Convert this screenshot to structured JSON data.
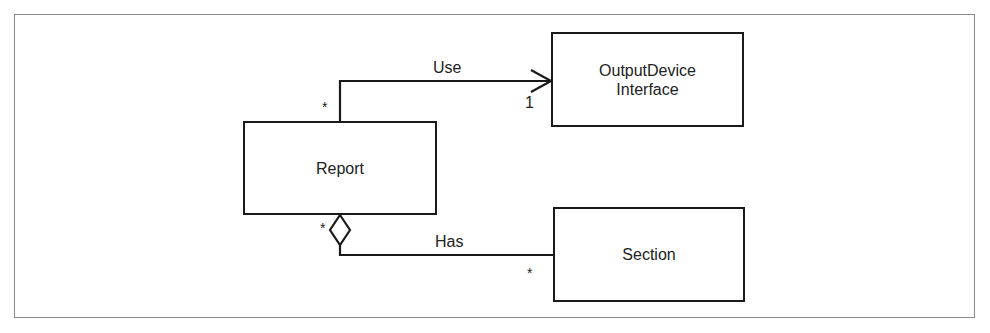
{
  "diagram": {
    "type": "UML class diagram",
    "classes": [
      {
        "id": "report",
        "name": "Report"
      },
      {
        "id": "output_device",
        "name_line1": "OutputDevice",
        "name_line2": "Interface"
      },
      {
        "id": "section",
        "name": "Section"
      }
    ],
    "associations": [
      {
        "label": "Use",
        "from": "Report",
        "to": "OutputDevice Interface",
        "from_multiplicity": "*",
        "to_multiplicity": "1",
        "kind": "directed-association"
      },
      {
        "label": "Has",
        "from": "Report",
        "to": "Section",
        "from_multiplicity": "*",
        "to_multiplicity": "*",
        "kind": "aggregation"
      }
    ]
  },
  "colors": {
    "line": "#1a1a1a",
    "frame": "#8a8a8a",
    "background": "#ffffff"
  }
}
